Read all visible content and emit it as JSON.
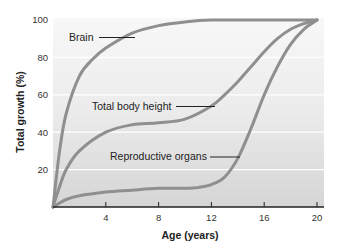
{
  "chart_data": {
    "type": "line",
    "title": "",
    "xlabel": "Age (years)",
    "ylabel": "Total growth (%)",
    "xlim": [
      0,
      20
    ],
    "ylim": [
      0,
      100
    ],
    "x_ticks": [
      4,
      8,
      12,
      16,
      20
    ],
    "y_ticks": [
      20,
      40,
      60,
      80,
      100
    ],
    "grid": "horizontal white lines at 20, 40, 60, 80",
    "legend": "inline annotations with leader lines",
    "series": [
      {
        "name": "Brain",
        "x": [
          0,
          0.5,
          1,
          2,
          3,
          4,
          6,
          8,
          10,
          12,
          16,
          20
        ],
        "values": [
          0,
          30,
          50,
          70,
          79,
          85,
          93,
          97,
          99,
          100,
          100,
          100
        ]
      },
      {
        "name": "Total body height",
        "x": [
          0,
          0.5,
          1,
          2,
          4,
          6,
          8,
          10,
          12,
          13,
          14,
          15,
          16,
          17,
          18,
          19,
          20
        ],
        "values": [
          0,
          11,
          20,
          30,
          40,
          44,
          45,
          47,
          54,
          60,
          67,
          75,
          83,
          90,
          95,
          98,
          100
        ]
      },
      {
        "name": "Reproductive organs",
        "x": [
          0,
          1,
          2,
          4,
          6,
          8,
          10,
          11,
          12,
          13,
          14,
          15,
          16,
          17,
          18,
          19,
          20
        ],
        "values": [
          0,
          4,
          6,
          8,
          9,
          10,
          10,
          10.5,
          12,
          16,
          26,
          42,
          60,
          75,
          87,
          95,
          100
        ]
      }
    ],
    "annotations": [
      {
        "text": "Brain",
        "points_to": {
          "x": 6.5,
          "y": 93
        }
      },
      {
        "text": "Total body height",
        "points_to": {
          "x": 12.5,
          "y": 57
        }
      },
      {
        "text": "Reproductive organs",
        "points_to": {
          "x": 14.3,
          "y": 32
        }
      }
    ]
  },
  "labels": {
    "xlabel": "Age (years)",
    "ylabel": "Total growth (%)",
    "x_ticks": [
      "4",
      "8",
      "12",
      "16",
      "20"
    ],
    "y_ticks": [
      "20",
      "40",
      "60",
      "80",
      "100"
    ],
    "annot_brain": "Brain",
    "annot_body": "Total body height",
    "annot_repro": "Reproductive organs"
  },
  "colors": {
    "curve": "#8f8f8f",
    "bg_top": "#f7f7f7",
    "bg_bottom": "#d6d6d6",
    "axis": "#222222"
  }
}
